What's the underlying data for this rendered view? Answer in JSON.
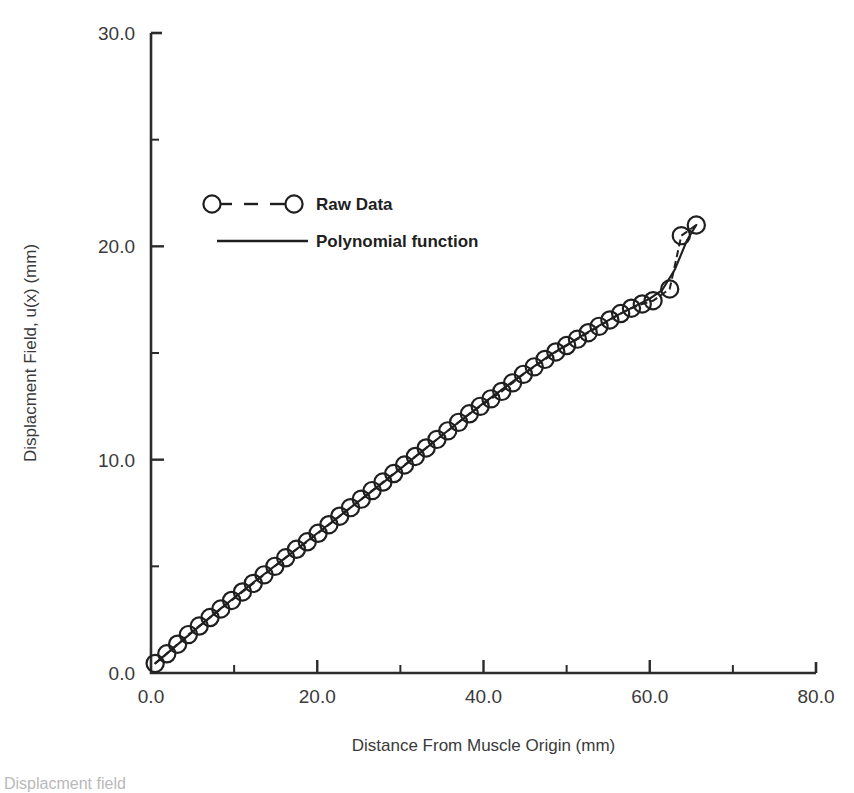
{
  "figure": {
    "background": "#ffffff",
    "ink_color": "#1f1f1f",
    "caption_fragment": "Displacment field"
  },
  "chart_data": {
    "type": "line",
    "title": "",
    "xlabel": "Distance From Muscle Origin (mm)",
    "ylabel": "Displacment Field, u(x) (mm)",
    "xlim": [
      0.0,
      80.0
    ],
    "ylim": [
      0.0,
      30.0
    ],
    "grid": false,
    "legend_position": "upper-left-inside",
    "x_major_ticks": [
      0.0,
      20.0,
      40.0,
      60.0,
      80.0
    ],
    "x_major_tick_labels": [
      "0.0",
      "20.0",
      "40.0",
      "60.0",
      "80.0"
    ],
    "x_minor_ticks": [
      10.0,
      30.0,
      50.0,
      70.0
    ],
    "y_major_ticks": [
      0.0,
      10.0,
      20.0,
      30.0
    ],
    "y_major_tick_labels": [
      "0.0",
      "10.0",
      "20.0",
      "30.0"
    ],
    "y_minor_ticks": [
      5.0,
      15.0,
      25.0
    ],
    "series": [
      {
        "name": "Raw Data",
        "style": "open-circles-dashed",
        "marker": "open-circle",
        "x": [
          0.5,
          1.9,
          3.2,
          4.5,
          5.8,
          7.1,
          8.4,
          9.7,
          11.0,
          12.3,
          13.6,
          14.9,
          16.2,
          17.5,
          18.8,
          20.1,
          21.4,
          22.7,
          24.0,
          25.3,
          26.6,
          27.9,
          29.2,
          30.5,
          31.8,
          33.1,
          34.4,
          35.7,
          37.0,
          38.3,
          39.6,
          40.9,
          42.2,
          43.5,
          44.8,
          46.1,
          47.4,
          48.7,
          50.0,
          51.3,
          52.6,
          53.9,
          55.2,
          56.5,
          57.8,
          59.1,
          60.4,
          62.4,
          63.8,
          65.6
        ],
        "y": [
          0.45,
          0.9,
          1.35,
          1.8,
          2.2,
          2.6,
          3.0,
          3.4,
          3.8,
          4.2,
          4.6,
          5.0,
          5.4,
          5.8,
          6.15,
          6.55,
          6.95,
          7.35,
          7.75,
          8.15,
          8.55,
          8.95,
          9.35,
          9.75,
          10.15,
          10.55,
          10.95,
          11.35,
          11.75,
          12.15,
          12.5,
          12.85,
          13.2,
          13.6,
          14.0,
          14.35,
          14.7,
          15.05,
          15.35,
          15.65,
          15.95,
          16.25,
          16.55,
          16.85,
          17.1,
          17.3,
          17.45,
          18.0,
          20.5,
          21.0
        ]
      },
      {
        "name": "Polynomial function",
        "style": "solid-line",
        "marker": "none",
        "x": [
          0.5,
          4.0,
          8.0,
          12.0,
          16.0,
          20.0,
          24.0,
          28.0,
          32.0,
          36.0,
          40.0,
          44.0,
          48.0,
          52.0,
          56.0,
          58.0,
          60.0,
          61.5,
          63.0,
          64.5,
          65.6
        ],
        "y": [
          0.45,
          1.6,
          2.9,
          4.15,
          5.35,
          6.55,
          7.75,
          8.95,
          10.2,
          11.45,
          12.65,
          13.8,
          14.9,
          15.85,
          16.75,
          17.15,
          17.55,
          17.95,
          18.9,
          20.3,
          21.0
        ]
      }
    ]
  },
  "legend": {
    "items": [
      {
        "label": "Raw Data",
        "style": "dashed-with-circles"
      },
      {
        "label": "Polynomial function",
        "style": "solid"
      }
    ]
  }
}
